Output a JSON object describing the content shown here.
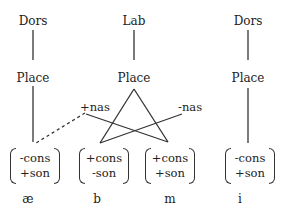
{
  "diagram": {
    "type": "feature-geometry",
    "columns": [
      {
        "id": "ae",
        "top_node": "Dors",
        "place": "Place",
        "features": [
          "-cons",
          "+son"
        ],
        "segment": "æ"
      },
      {
        "id": "b",
        "top_node": "Lab",
        "place": "Place",
        "features": [
          "+cons",
          "-son"
        ],
        "segment": "b"
      },
      {
        "id": "m",
        "top_node": null,
        "place": null,
        "features": [
          "+cons",
          "+son"
        ],
        "segment": "m"
      },
      {
        "id": "i",
        "top_node": "Dors",
        "place": "Place",
        "features": [
          "-cons",
          "+son"
        ],
        "segment": "i"
      }
    ],
    "nasal_labels": {
      "plus": "+nas",
      "minus": "-nas"
    },
    "links": [
      {
        "from": "Dors(æ)",
        "to": "Place(æ)",
        "style": "solid"
      },
      {
        "from": "Place(æ)",
        "to": "matrix(æ)",
        "style": "solid"
      },
      {
        "from": "+nas",
        "to": "matrix(æ)",
        "style": "dashed"
      },
      {
        "from": "+nas",
        "to": "matrix(m)",
        "style": "solid"
      },
      {
        "from": "-nas",
        "to": "matrix(b)",
        "style": "solid"
      },
      {
        "from": "Lab",
        "to": "Place(shared)",
        "style": "solid"
      },
      {
        "from": "Place(shared)",
        "to": "matrix(b)",
        "style": "solid"
      },
      {
        "from": "Place(shared)",
        "to": "matrix(m)",
        "style": "solid"
      },
      {
        "from": "Dors(i)",
        "to": "Place(i)",
        "style": "solid"
      },
      {
        "from": "Place(i)",
        "to": "matrix(i)",
        "style": "solid"
      }
    ]
  }
}
